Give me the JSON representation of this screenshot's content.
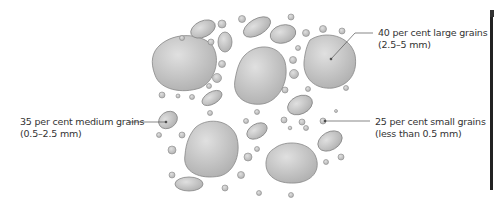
{
  "diagram": {
    "labels": [
      {
        "id": "large",
        "line1": "40 per cent large grains",
        "line2": "(2.5–5 mm)"
      },
      {
        "id": "medium",
        "line1": "35 per cent medium grains",
        "line2": "(0.5–2.5 mm)"
      },
      {
        "id": "small",
        "line1": "25 per cent small grains",
        "line2": "(less than 0.5 mm)"
      }
    ],
    "colors": {
      "grain_fill": "#c4c4c4",
      "grain_stroke": "#808080",
      "leader": "#555555",
      "text": "#333333"
    }
  }
}
